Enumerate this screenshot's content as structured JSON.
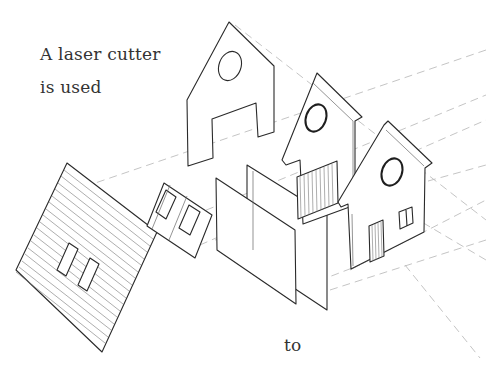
{
  "diagram": {
    "type": "exploded isometric illustration",
    "captions": {
      "line1": "A laser cutter",
      "line2": "is used",
      "bottom": "to"
    },
    "parts": [
      {
        "name": "front-gable-panel-with-doorway",
        "features": [
          "round window",
          "rectangular door opening"
        ]
      },
      {
        "name": "middle-gable-frame",
        "features": [
          "round window",
          "vertical slatted garage door"
        ]
      },
      {
        "name": "rear-gable-house-facade",
        "features": [
          "round window",
          "double window",
          "slatted door"
        ]
      },
      {
        "name": "roof-panel",
        "features": [
          "horizontal siding slats",
          "two window cutouts"
        ]
      },
      {
        "name": "window-frame-piece",
        "features": [
          "two window openings"
        ]
      },
      {
        "name": "side-wall-panels",
        "features": [
          "two flat rectangular panels"
        ]
      }
    ],
    "colors": {
      "line": "#2a2a2a",
      "dashed_projection": "#bdbdbd",
      "text": "#333333",
      "background": "#ffffff"
    }
  }
}
